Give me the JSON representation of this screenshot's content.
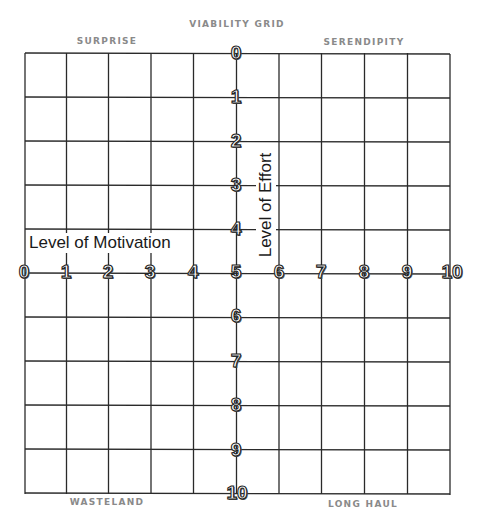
{
  "title": "VIABILITY GRID",
  "quadrants": {
    "top_left": "SURPRISE",
    "top_right": "SERENDIPITY",
    "bottom_left": "WASTELAND",
    "bottom_right": "LONG HAUL"
  },
  "axes": {
    "horizontal": {
      "label": "Level of Motivation",
      "ticks": [
        "0",
        "1",
        "2",
        "3",
        "4",
        "5",
        "6",
        "7",
        "8",
        "9",
        "10"
      ]
    },
    "vertical": {
      "label": "Level of Effort",
      "ticks": [
        "0",
        "1",
        "2",
        "3",
        "4",
        "5",
        "6",
        "7",
        "8",
        "9",
        "10"
      ]
    }
  },
  "grid": {
    "columns": 10,
    "rows": 10,
    "line_color": "#2a2a2a",
    "caption_color": "#8a8a8a"
  }
}
